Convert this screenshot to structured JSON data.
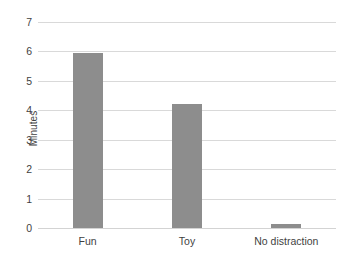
{
  "chart_data": {
    "type": "bar",
    "title": "",
    "xlabel": "",
    "ylabel": "Minutes",
    "categories": [
      "Fun",
      "Toy",
      "No distraction"
    ],
    "values": [
      5.95,
      4.2,
      0.12
    ],
    "series": [
      {
        "name": "Minutes",
        "values": [
          5.95,
          4.2,
          0.12
        ]
      }
    ],
    "ylim": [
      0,
      7
    ],
    "ytick_labels": [
      "0",
      "1",
      "2",
      "3",
      "4",
      "5",
      "6",
      "7"
    ],
    "ytick_values": [
      0,
      1,
      2,
      3,
      4,
      5,
      6,
      7
    ],
    "grid": "horizontal",
    "legend": "none",
    "bar_color": "#8d8d8d",
    "gridline_color": "#d9d9d9",
    "text_color": "#3f3f3f",
    "background_color": "#ffffff"
  }
}
